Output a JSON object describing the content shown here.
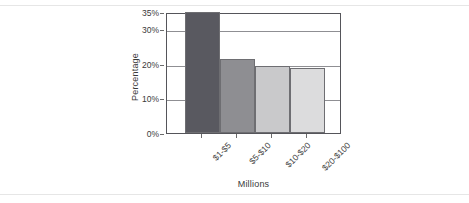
{
  "chart_data": {
    "type": "bar",
    "title": "",
    "xlabel": "Millions",
    "ylabel": "Percentage",
    "categories": [
      "$1-$5",
      "$5-$10",
      "$10-$20",
      "$20-$100"
    ],
    "values": [
      35,
      21.5,
      19.5,
      18.7
    ],
    "ylim": [
      0,
      35
    ],
    "ytick_values": [
      0,
      10,
      20,
      30,
      35
    ],
    "ytick_labels": [
      "0%",
      "10%",
      "20%",
      "30%",
      "35%"
    ],
    "grid": true,
    "gridlines_at": [
      10,
      20,
      30
    ],
    "legend": "none",
    "bar_colors": [
      "#595960",
      "#8e8e92",
      "#c9c9cb",
      "#dcdcdd"
    ],
    "bar_edge_color": "#6e6e72",
    "axis_color": "#55555a"
  },
  "figure": {
    "y_axis_title": "Percentage",
    "x_axis_title": "Millions"
  }
}
